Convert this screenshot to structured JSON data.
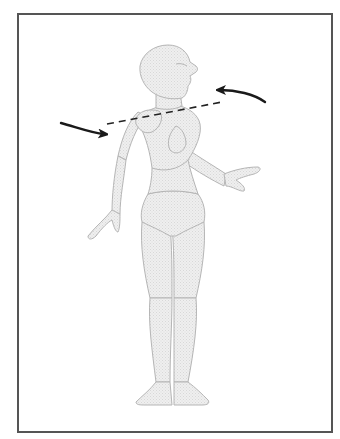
{
  "diagram": {
    "frame": {
      "border_color": "#555555",
      "background": "#ffffff"
    },
    "figure": {
      "fill_color": "#ececec",
      "outline_color": "#b5b5b5",
      "parts": [
        "head",
        "neck",
        "torso",
        "left-arm",
        "right-arm",
        "left-hand",
        "right-hand",
        "pelvis",
        "left-leg",
        "right-leg",
        "left-foot",
        "right-foot"
      ]
    },
    "annotations": {
      "rotation_axis": {
        "style": "dashed",
        "color": "#222222"
      },
      "arrows": [
        {
          "id": "front-arrow",
          "direction": "right",
          "color": "#1a1a1a"
        },
        {
          "id": "back-arrow",
          "direction": "left",
          "color": "#1a1a1a"
        }
      ]
    },
    "caption": "Shoulder rotation around axis"
  }
}
